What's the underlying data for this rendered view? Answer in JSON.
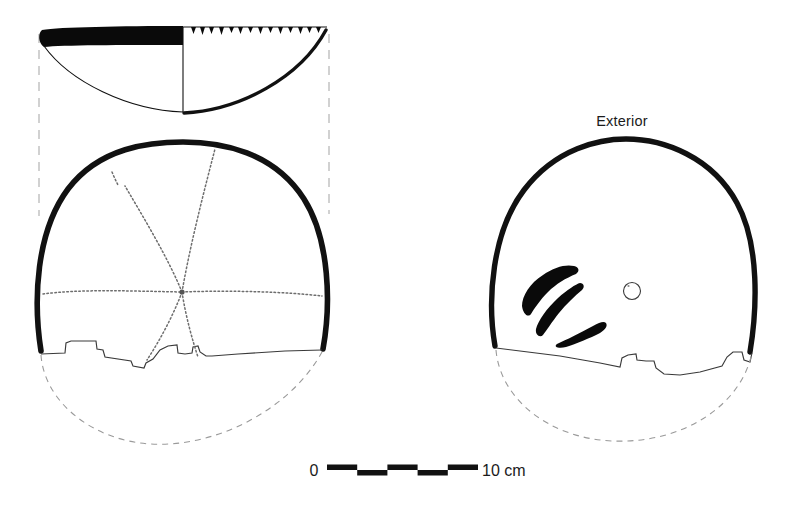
{
  "figure": {
    "kind": "archaeological-artifact-illustration",
    "background_color": "#ffffff",
    "ink_color": "#0a0a0a",
    "reconstruction_line_color": "#9a9a9a",
    "projection_line_color": "#b3b3b3",
    "incision_line_color": "#6e6e6e"
  },
  "labels": {
    "exterior": "Exterior"
  },
  "scale_bar": {
    "start_label": "0",
    "end_label": "10 cm",
    "unit": "cm",
    "total_length_cm": 10,
    "segments": 5,
    "segment_length_cm": 2,
    "x_start_px": 327,
    "x_end_px": 478,
    "y_px": 470,
    "bar_color": "#111111"
  },
  "views": {
    "section": {
      "name": "rim-section-profile",
      "center_x": 183,
      "rim_y": 32,
      "left_x": 40,
      "right_x": 327,
      "rim_band_height": 17,
      "rim_notch_count": 17,
      "notch_description": "small triangular notches along exterior rim edge"
    },
    "interior_plan": {
      "name": "interior-plan-view",
      "center_x": 183,
      "center_y": 292,
      "radius_x": 144,
      "radius_y": 148,
      "converge_point_x": 182,
      "converge_point_y": 292,
      "incised_ray_count": 6,
      "feature": "radiating incised lines converging at basal point"
    },
    "exterior_plan": {
      "name": "exterior-plan-view",
      "center_x": 622,
      "center_y": 268,
      "radius_x": 132,
      "radius_y": 130,
      "brush_stroke_count": 3,
      "perforation": {
        "cx": 632,
        "cy": 291,
        "r": 8.5
      },
      "feature": "three curved black painted strokes and one small perforation"
    }
  }
}
